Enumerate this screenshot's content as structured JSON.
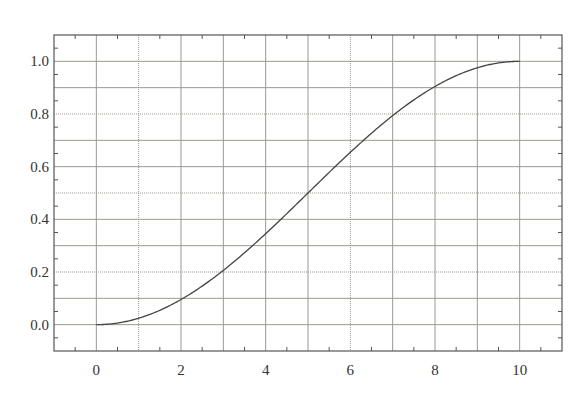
{
  "chart_data": {
    "type": "line",
    "title": "",
    "xlabel": "",
    "ylabel": "",
    "xlim": [
      -1,
      11
    ],
    "ylim": [
      -0.1,
      1.1
    ],
    "grid": true,
    "legend": null,
    "x_ticks": [
      0,
      2,
      4,
      6,
      8,
      10
    ],
    "x_tick_labels": [
      "0",
      "2",
      "4",
      "6",
      "8",
      "10"
    ],
    "y_ticks": [
      0.0,
      0.2,
      0.4,
      0.6,
      0.8,
      1.0
    ],
    "y_tick_labels": [
      "0.0",
      "0.2",
      "0.4",
      "0.6",
      "0.8",
      "1.0"
    ],
    "x_gridlines": [
      0,
      1,
      2,
      3,
      4,
      5,
      6,
      7,
      8,
      9,
      10
    ],
    "y_gridlines": [
      0.0,
      0.1,
      0.2,
      0.3,
      0.4,
      0.5,
      0.6,
      0.7,
      0.8,
      0.9,
      1.0
    ],
    "dotted_x_gridlines": [
      1,
      6
    ],
    "dotted_y_gridlines": [
      0.2,
      0.5,
      0.8
    ],
    "series": [
      {
        "name": "curve",
        "color": "#444444",
        "x": [
          0,
          0.5,
          1,
          1.5,
          2,
          2.5,
          3,
          3.5,
          4,
          4.5,
          5,
          5.5,
          6,
          6.5,
          7,
          7.5,
          8,
          8.5,
          9,
          9.5,
          10
        ],
        "y": [
          0.0,
          0.006,
          0.024,
          0.054,
          0.095,
          0.146,
          0.206,
          0.273,
          0.345,
          0.422,
          0.5,
          0.578,
          0.655,
          0.727,
          0.794,
          0.854,
          0.905,
          0.946,
          0.976,
          0.994,
          1.0
        ]
      }
    ]
  },
  "colors": {
    "frame": "#555555",
    "grid": "#9a9a90",
    "text": "#333333"
  }
}
